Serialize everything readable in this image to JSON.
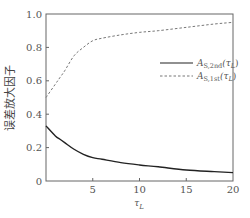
{
  "chart_data": {
    "type": "line",
    "title": "",
    "xlabel": "τ_L",
    "ylabel": "误差放大因子",
    "xlim": [
      0,
      20
    ],
    "ylim": [
      0,
      1.0
    ],
    "grid": false,
    "legend_position": "center-right",
    "x_ticks": [
      "5",
      "10",
      "15",
      "20"
    ],
    "y_ticks": [
      "0",
      "0.2",
      "0.4",
      "0.6",
      "0.8",
      "1.0"
    ],
    "x": [
      0,
      1,
      1.5,
      2,
      3,
      4,
      5,
      6,
      8,
      10,
      12,
      15,
      18,
      20
    ],
    "series": [
      {
        "name": "A_S,2nd(τ_L)",
        "style": "solid",
        "color": "#222222",
        "values": [
          0.33,
          0.27,
          0.25,
          0.23,
          0.19,
          0.16,
          0.14,
          0.13,
          0.11,
          0.096,
          0.085,
          0.066,
          0.056,
          0.05
        ]
      },
      {
        "name": "A_S,1st(τ_L)",
        "style": "dashed",
        "color": "#777777",
        "values": [
          0.5,
          0.58,
          0.62,
          0.66,
          0.75,
          0.8,
          0.84,
          0.855,
          0.875,
          0.89,
          0.9,
          0.92,
          0.94,
          0.95
        ]
      }
    ]
  },
  "legend": {
    "items": [
      {
        "main": "A",
        "sub": "S,2nd",
        "arg": "(τ",
        "arg_sub": "L",
        "close": ")"
      },
      {
        "main": "A",
        "sub": "S,1st",
        "arg": "(τ",
        "arg_sub": "L",
        "close": ")"
      }
    ]
  },
  "axes": {
    "xlabel_main": "τ",
    "xlabel_sub": "L",
    "ylabel": "误差放大因子"
  }
}
